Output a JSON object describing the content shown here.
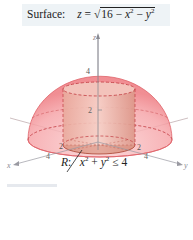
{
  "header": {
    "label": "Surface:",
    "equation_lhs": "z",
    "equals": "=",
    "sqrt_symbol": "√",
    "radicand_const": "16",
    "minus1": "−",
    "x_var": "x",
    "x_exp": "2",
    "minus2": "−",
    "y_var": "y",
    "y_exp": "2"
  },
  "figure": {
    "axis_labels": {
      "x": "x",
      "y": "y",
      "z": "z"
    },
    "ticks": {
      "z_top": "4",
      "z_mid": "2",
      "x_inner": "2",
      "x_outer": "4",
      "y_inner": "2",
      "y_outer": "4"
    },
    "colors": {
      "hemisphere": "#f08a8f",
      "cylinder": "#d98b7e",
      "axis": "#9a9aa2",
      "dashed": "#c0393f"
    }
  },
  "region": {
    "name": "R",
    "colon": ":",
    "x_var": "x",
    "x_exp": "2",
    "plus": "+",
    "y_var": "y",
    "y_exp": "2",
    "rel": "≤",
    "bound": "4"
  }
}
